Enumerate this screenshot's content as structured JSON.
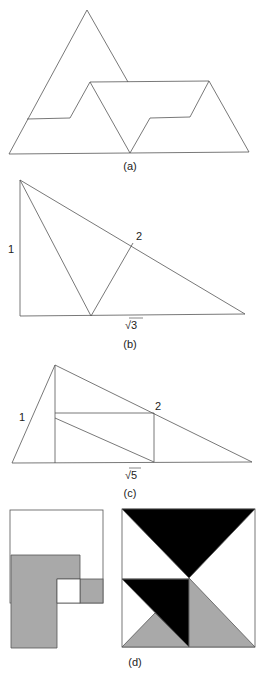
{
  "figures": {
    "a": {
      "caption": "(a)"
    },
    "b": {
      "caption": "(b)",
      "side_label_left": "1",
      "side_label_hyp": "2",
      "base_label": "√3"
    },
    "c": {
      "caption": "(c)",
      "side_label_left": "1",
      "side_label_hyp": "2",
      "base_label": "√5"
    },
    "d": {
      "caption": "(d)"
    }
  },
  "colors": {
    "stroke": "#555555",
    "gray_fill": "#a9a9a9",
    "black_fill": "#000000",
    "background": "#ffffff"
  }
}
